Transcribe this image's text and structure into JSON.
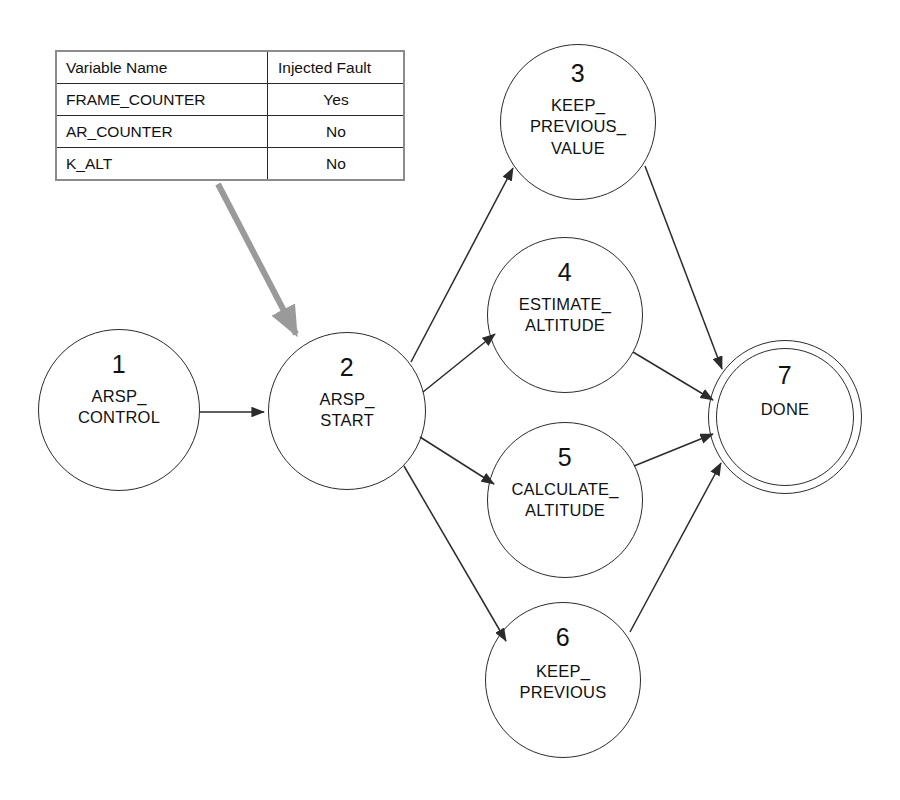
{
  "diagram": {
    "type": "state-machine",
    "colors": {
      "node_stroke": "#2b2b2b",
      "edge_stroke": "#2b2b2b",
      "table_border": "#8c8c8c",
      "table_rule": "#2a2a2a",
      "annotation_arrow": "#9a9a9a",
      "background": "#ffffff",
      "text": "#111111"
    }
  },
  "fault_table": {
    "name": "variable-fault-table",
    "headers": [
      "Variable Name",
      "Injected Fault"
    ],
    "rows": [
      {
        "variable": "FRAME_COUNTER",
        "injected_fault": "Yes"
      },
      {
        "variable": "AR_COUNTER",
        "injected_fault": "No"
      },
      {
        "variable": "K_ALT",
        "injected_fault": "No"
      }
    ]
  },
  "states": [
    {
      "id": "1",
      "label": "ARSP_\nCONTROL",
      "cx": 119,
      "cy": 410,
      "r": 81,
      "final": false,
      "id_offset": 22,
      "label_offset": 56
    },
    {
      "id": "2",
      "label": "ARSP_\nSTART",
      "cx": 347,
      "cy": 411,
      "r": 79,
      "final": false,
      "id_offset": 22,
      "label_offset": 56
    },
    {
      "id": "3",
      "label": "KEEP_\nPREVIOUS_\nVALUE",
      "cx": 578,
      "cy": 122,
      "r": 78,
      "final": false,
      "id_offset": 16,
      "label_offset": 50
    },
    {
      "id": "4",
      "label": "ESTIMATE_\nALTITUDE",
      "cx": 565,
      "cy": 315,
      "r": 78,
      "final": false,
      "id_offset": 22,
      "label_offset": 56
    },
    {
      "id": "5",
      "label": "CALCULATE_\nALTITUDE",
      "cx": 565,
      "cy": 500,
      "r": 78,
      "final": false,
      "id_offset": 22,
      "label_offset": 56
    },
    {
      "id": "6",
      "label": "KEEP_\nPREVIOUS",
      "cx": 563,
      "cy": 680,
      "r": 78,
      "final": false,
      "id_offset": 22,
      "label_offset": 58
    },
    {
      "id": "7",
      "label": "DONE",
      "cx": 785,
      "cy": 417,
      "r": 77,
      "final": true,
      "id_offset": 22,
      "label_offset": 58
    }
  ],
  "transitions": [
    {
      "name": "edge-1-to-2",
      "from": "1",
      "to": "2",
      "path": "M 200 412 L 264 412"
    },
    {
      "name": "edge-2-to-3",
      "from": "2",
      "to": "3",
      "path": "M 411 362 L 513 168"
    },
    {
      "name": "edge-2-to-4",
      "from": "2",
      "to": "4",
      "path": "M 423 392 L 495 334"
    },
    {
      "name": "edge-2-to-5",
      "from": "2",
      "to": "5",
      "path": "M 420 437 L 494 484"
    },
    {
      "name": "edge-2-to-6",
      "from": "2",
      "to": "6",
      "path": "M 404 466 L 506 641"
    },
    {
      "name": "edge-3-to-7",
      "from": "3",
      "to": "7",
      "path": "M 645 166 L 722 369"
    },
    {
      "name": "edge-4-to-7",
      "from": "4",
      "to": "7",
      "path": "M 633 352 L 713 400"
    },
    {
      "name": "edge-5-to-7",
      "from": "5",
      "to": "7",
      "path": "M 634 466 L 713 434"
    },
    {
      "name": "edge-6-to-7",
      "from": "6",
      "to": "7",
      "path": "M 630 632 L 721 463"
    }
  ],
  "annotation": {
    "name": "fault-table-to-state2-arrow",
    "path": "M 218 184 L 296 334",
    "color": "#9a9a9a",
    "description": "Gray arrow linking fault table to state 2 ARSP_START"
  }
}
